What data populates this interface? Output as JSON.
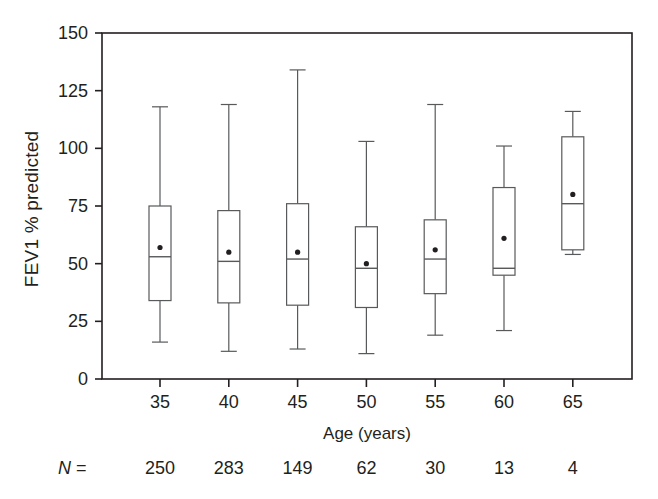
{
  "chart_data": {
    "type": "box",
    "title": "",
    "xlabel": "Age (years)",
    "ylabel": "FEV1 % predicted",
    "ylim": [
      0,
      150
    ],
    "yticks": [
      0,
      25,
      50,
      75,
      100,
      125,
      150
    ],
    "ytick_labels": [
      "0",
      "25",
      "50",
      "75",
      "100",
      "125",
      "150"
    ],
    "categories": [
      "35",
      "40",
      "45",
      "50",
      "55",
      "60",
      "65"
    ],
    "grid": false,
    "legend": null,
    "n_label": "N",
    "n_equals_sign": "=",
    "n_values": [
      "250",
      "283",
      "149",
      "62",
      "30",
      "13",
      "4"
    ],
    "boxes": [
      {
        "category": "35",
        "whisker_low": 16,
        "q1": 34,
        "median": 53,
        "q3": 75,
        "whisker_high": 118,
        "mean": 57
      },
      {
        "category": "40",
        "whisker_low": 12,
        "q1": 33,
        "median": 51,
        "q3": 73,
        "whisker_high": 119,
        "mean": 55
      },
      {
        "category": "45",
        "whisker_low": 13,
        "q1": 32,
        "median": 52,
        "q3": 76,
        "whisker_high": 134,
        "mean": 55
      },
      {
        "category": "50",
        "whisker_low": 11,
        "q1": 31,
        "median": 48,
        "q3": 66,
        "whisker_high": 103,
        "mean": 50
      },
      {
        "category": "55",
        "whisker_low": 19,
        "q1": 37,
        "median": 52,
        "q3": 69,
        "whisker_high": 119,
        "mean": 56
      },
      {
        "category": "60",
        "whisker_low": 21,
        "q1": 45,
        "median": 48,
        "q3": 83,
        "whisker_high": 101,
        "mean": 61
      },
      {
        "category": "65",
        "whisker_low": 54,
        "q1": 56,
        "median": 76,
        "q3": 105,
        "whisker_high": 116,
        "mean": 80
      }
    ],
    "colors": {
      "axis": "#231f20",
      "box_stroke": "#58595b",
      "box_fill": "#ffffff",
      "whisker": "#58595b",
      "mean_marker": "#231f20",
      "text": "#231f20"
    }
  }
}
